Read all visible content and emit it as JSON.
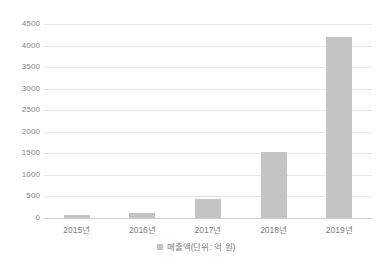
{
  "chart_data": {
    "type": "bar",
    "title": "",
    "subtitle": "",
    "xlabel": "",
    "ylabel": "",
    "categories": [
      "2015년",
      "2016년",
      "2017년",
      "2018년",
      "2019년"
    ],
    "series": [
      {
        "name": "매출액(단위: 억 원)",
        "values": [
          70,
          120,
          450,
          1540,
          4200
        ]
      }
    ],
    "values": [
      70,
      120,
      450,
      1540,
      4200
    ],
    "ylim": [
      0,
      4500
    ],
    "y_ticks": [
      0,
      500,
      1000,
      1500,
      2000,
      2500,
      3000,
      3500,
      4000,
      4500
    ],
    "y_tick_labels": [
      "0",
      "500",
      "1000",
      "1500",
      "2000",
      "2500",
      "3000",
      "3500",
      "4000",
      "4500"
    ],
    "grid": true,
    "grid_axis": "y",
    "legend": {
      "position": "bottom-center",
      "entries": [
        {
          "label": "매출액(단위: 억 원)",
          "color": "#c4c4c4",
          "marker": "square-swatch"
        }
      ]
    },
    "colors": {
      "bar": "#c4c4c4",
      "gridline": "#e6e6e6",
      "axis": "#cfcfcf",
      "tick_label": "#7d7d7d",
      "background": "#ffffff"
    }
  }
}
